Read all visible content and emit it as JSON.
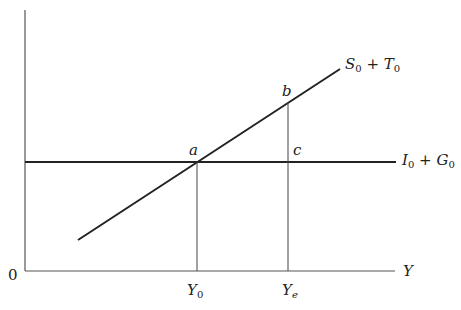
{
  "diagram": {
    "type": "macroeconomic equilibrium (leakages vs injections)",
    "origin_label": "0",
    "x_axis_label": "Y",
    "lines": [
      {
        "name": "S0 + T0",
        "base": "S",
        "sub1": "0",
        "op": "+",
        "base2": "T",
        "sub2": "0",
        "kind": "upward sloping"
      },
      {
        "name": "I0 + G0",
        "base": "I",
        "sub1": "0",
        "op": "+",
        "base2": "G",
        "sub2": "0",
        "kind": "horizontal"
      }
    ],
    "points": {
      "a": "a",
      "b": "b",
      "c": "c"
    },
    "x_ticks": [
      {
        "base": "Y",
        "sub": "0"
      },
      {
        "base": "Y",
        "sub": "e"
      }
    ],
    "colors": {
      "line": "#222222",
      "thin": "#555555",
      "background": "#ffffff"
    }
  }
}
